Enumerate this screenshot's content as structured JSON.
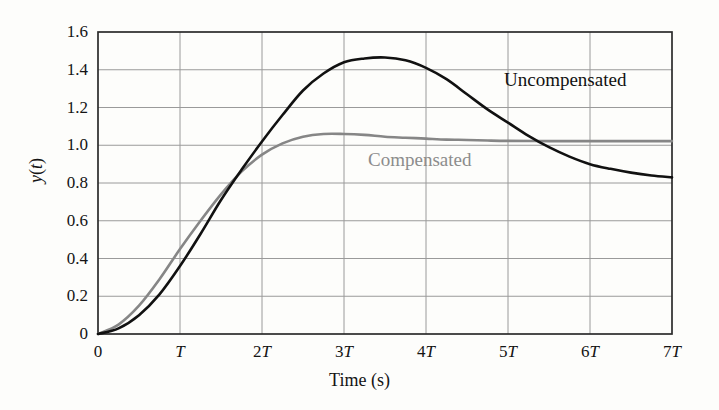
{
  "figure": {
    "background_color": "#fdfdfb",
    "plot_area": {
      "left": 98,
      "top": 32,
      "right": 672,
      "bottom": 334
    }
  },
  "chart_data": {
    "type": "line",
    "title": "",
    "xlabel": "Time (s)",
    "ylabel": "y(t)",
    "xlim": [
      0,
      7
    ],
    "ylim": [
      0,
      1.6
    ],
    "grid": true,
    "legend_position": "inline-annotations",
    "x_tick_labels": [
      "0",
      "T",
      "2T",
      "3T",
      "4T",
      "5T",
      "6T",
      "7T"
    ],
    "x_tick_values": [
      0,
      1,
      2,
      3,
      4,
      5,
      6,
      7
    ],
    "y_tick_labels": [
      "0",
      "0.2",
      "0.4",
      "0.6",
      "0.8",
      "1.0",
      "1.2",
      "1.4",
      "1.6"
    ],
    "y_tick_values": [
      0,
      0.2,
      0.4,
      0.6,
      0.8,
      1.0,
      1.2,
      1.4,
      1.6
    ],
    "series": [
      {
        "name": "Uncompensated",
        "color": "#111111",
        "width": 2.6,
        "label_text": "Uncompensated",
        "x": [
          0,
          0.25,
          0.5,
          0.75,
          1.0,
          1.25,
          1.5,
          1.75,
          2.0,
          2.25,
          2.5,
          2.75,
          3.0,
          3.25,
          3.5,
          3.75,
          4.0,
          4.25,
          4.5,
          4.75,
          5.0,
          5.25,
          5.5,
          5.75,
          6.0,
          6.25,
          6.5,
          6.75,
          7.0
        ],
        "y": [
          0.0,
          0.03,
          0.1,
          0.21,
          0.36,
          0.53,
          0.71,
          0.87,
          1.02,
          1.16,
          1.29,
          1.38,
          1.44,
          1.46,
          1.465,
          1.45,
          1.41,
          1.35,
          1.27,
          1.19,
          1.12,
          1.05,
          0.99,
          0.94,
          0.9,
          0.875,
          0.855,
          0.84,
          0.83
        ]
      },
      {
        "name": "Compensated",
        "color": "#868686",
        "width": 2.6,
        "label_text": "Compensated",
        "x": [
          0,
          0.25,
          0.5,
          0.75,
          1.0,
          1.25,
          1.5,
          1.75,
          2.0,
          2.25,
          2.5,
          2.75,
          3.0,
          3.25,
          3.5,
          3.75,
          4.0,
          4.25,
          4.5,
          4.75,
          5.0,
          5.5,
          6.0,
          6.5,
          7.0
        ],
        "y": [
          0.0,
          0.05,
          0.15,
          0.29,
          0.45,
          0.6,
          0.74,
          0.86,
          0.95,
          1.01,
          1.045,
          1.06,
          1.06,
          1.055,
          1.045,
          1.04,
          1.035,
          1.03,
          1.028,
          1.025,
          1.023,
          1.022,
          1.022,
          1.022,
          1.022
        ]
      }
    ]
  }
}
